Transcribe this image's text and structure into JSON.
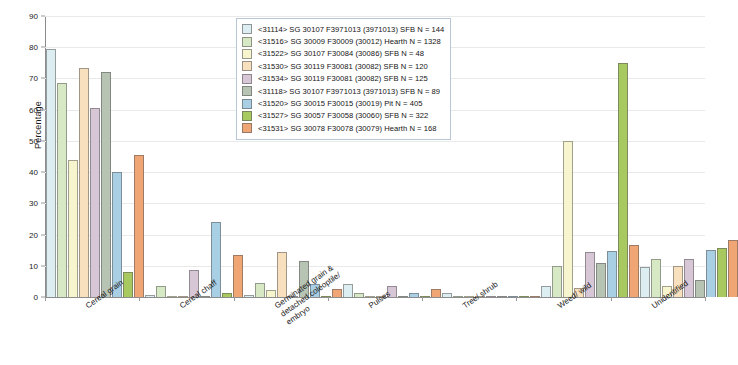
{
  "chart_data": {
    "type": "bar",
    "title": "",
    "xlabel": "",
    "ylabel": "Percentage",
    "ylim": [
      0,
      90
    ],
    "yticks": [
      0,
      10,
      20,
      30,
      40,
      50,
      60,
      70,
      80,
      90
    ],
    "grid": true,
    "legend_position": "top-center",
    "categories": [
      "Cereal grain",
      "Cereal chaff",
      "Germinated grain &\ndetached coleoptile/\nembryo",
      "Pulses",
      "Tree/ shrub",
      "Weed/ wild",
      "Unidentified"
    ],
    "series": [
      {
        "name": "<31114> SG 30107 F3971013 (3971013) SFB N = 144",
        "color": "#dceef2",
        "values": [
          79.5,
          0.7,
          0.7,
          4.2,
          1.3,
          3.4,
          9.5
        ]
      },
      {
        "name": "<31516> SG 30009 F30009 (30012) Hearth N = 1328",
        "color": "#d7e8c4",
        "values": [
          68.5,
          3.4,
          4.5,
          1.2,
          0.0,
          10.0,
          12.3
        ]
      },
      {
        "name": "<31522> SG 30107 F30084 (30086) SFB N = 48",
        "color": "#f7f5cd",
        "values": [
          44.0,
          0.2,
          2.4,
          0.0,
          0.0,
          50.0,
          3.6
        ]
      },
      {
        "name": "<31530> SG 30119 F30081 (30082) SFB N = 120",
        "color": "#f8dfbd",
        "values": [
          73.5,
          0.0,
          14.5,
          0.0,
          0.0,
          2.8,
          9.8
        ]
      },
      {
        "name": "<31534> SG 30119 F30081 (30082) SFB N = 125",
        "color": "#d7c6d6",
        "values": [
          60.5,
          8.5,
          0.0,
          3.5,
          0.0,
          14.3,
          12.3
        ]
      },
      {
        "name": "<31118> SG 30107 F3971013 (3971013) SFB N = 89",
        "color": "#b7c4b4",
        "values": [
          72.0,
          0.3,
          11.5,
          0.2,
          0.0,
          11.0,
          5.6
        ]
      },
      {
        "name": "<31520> SG 30015 F30015 (30019) Pit N = 405",
        "color": "#a9cfe4",
        "values": [
          40.0,
          24.0,
          4.2,
          1.4,
          0.0,
          14.8,
          15.0
        ]
      },
      {
        "name": "<31527> SG 30057 F30058 (30060) SFB N = 322",
        "color": "#a8c860",
        "values": [
          8.0,
          1.4,
          0.0,
          0.0,
          0.0,
          75.0,
          15.8
        ]
      },
      {
        "name": "<31531> SG 30078 F30078 (30079) Hearth N = 168",
        "color": "#f0a575",
        "values": [
          45.5,
          13.5,
          2.5,
          2.5,
          0.0,
          16.5,
          18.3
        ]
      }
    ]
  }
}
